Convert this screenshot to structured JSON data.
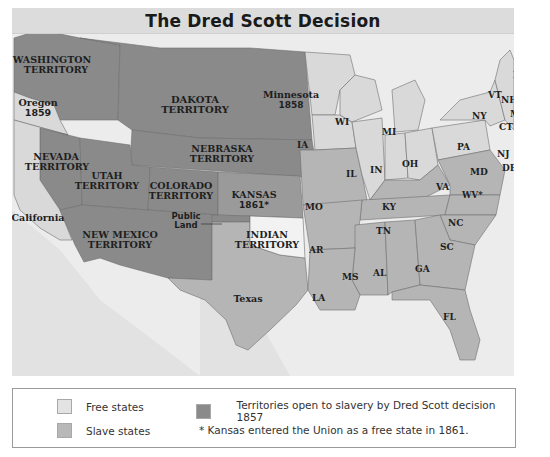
{
  "title": "The Dred Scott Decision",
  "colors": {
    "free": "#d9d9d9",
    "slave": "#b5b5b5",
    "territory": "#8a8a8a",
    "indian_territory": "#f2f2f2",
    "water": "#ececec",
    "foreign": "#e4e4e4",
    "border": "#6e6e6e"
  },
  "regions": {
    "washington": {
      "line1": "WASHINGTON",
      "line2": "TERRITORY"
    },
    "oregon": {
      "line1": "Oregon",
      "line2": "1859"
    },
    "dakota": {
      "line1": "DAKOTA",
      "line2": "TERRITORY"
    },
    "minnesota": {
      "line1": "Minnesota",
      "line2": "1858"
    },
    "nebraska": {
      "line1": "NEBRASKA",
      "line2": "TERRITORY"
    },
    "nevada": {
      "line1": "NEVADA",
      "line2": "TERRITORY"
    },
    "utah": {
      "line1": "UTAH",
      "line2": "TERRITORY"
    },
    "colorado": {
      "line1": "COLORADO",
      "line2": "TERRITORY"
    },
    "kansas": {
      "line1": "KANSAS",
      "line2": "1861*"
    },
    "california": {
      "line1": "California"
    },
    "public_land": {
      "line1": "Public",
      "line2": "Land"
    },
    "new_mexico": {
      "line1": "NEW MEXICO",
      "line2": "TERRITORY"
    },
    "indian": {
      "line1": "INDIAN",
      "line2": "TERRITORY"
    },
    "texas": {
      "line1": "Texas"
    },
    "states": {
      "WI": "WI",
      "MI": "MI",
      "IA": "IA",
      "IL": "IL",
      "IN": "IN",
      "OH": "OH",
      "PA": "PA",
      "NY": "NY",
      "VT": "VT",
      "NH": "NH",
      "ME": "ME",
      "MA": "MA",
      "CT": "CT",
      "RI": "RI",
      "NJ": "NJ",
      "DE": "DE",
      "MD": "MD",
      "VA": "VA",
      "WV": "WV*",
      "KY": "KY",
      "MO": "MO",
      "TN": "TN",
      "NC": "NC",
      "SC": "SC",
      "AR": "AR",
      "MS": "MS",
      "AL": "AL",
      "GA": "GA",
      "LA": "LA",
      "FL": "FL"
    }
  },
  "legend": {
    "free_label": "Free states",
    "slave_label": "Slave states",
    "territory_label": "Territories open to slavery by Dred Scott decision 1857",
    "kansas_note": "* Kansas entered the Union as a free state in 1861."
  }
}
